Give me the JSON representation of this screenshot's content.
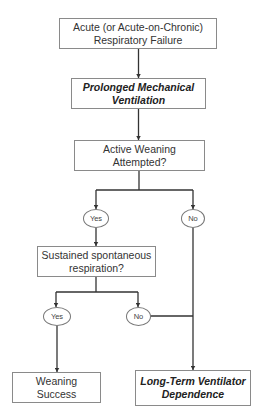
{
  "diagram": {
    "type": "flowchart",
    "nodes": {
      "start": {
        "label": "Acute (or Acute-on-Chronic)\nRespiratory Failure",
        "style": "normal"
      },
      "pmv": {
        "label": "Prolonged Mechanical\nVentilation",
        "style": "bold-italic"
      },
      "weaning_q": {
        "label": "Active Weaning\nAttempted?",
        "style": "normal"
      },
      "yes1": {
        "label": "Yes"
      },
      "no1": {
        "label": "No"
      },
      "sustained_q": {
        "label": "Sustained spontaneous\nrespiration?",
        "style": "normal"
      },
      "yes2": {
        "label": "Yes"
      },
      "no2": {
        "label": "No"
      },
      "success": {
        "label": "Weaning\nSuccess",
        "style": "normal"
      },
      "ltvd": {
        "label": "Long-Term Ventilator\nDependence",
        "style": "bold-italic"
      }
    },
    "edges": [
      [
        "start",
        "pmv"
      ],
      [
        "pmv",
        "weaning_q"
      ],
      [
        "weaning_q",
        "yes1"
      ],
      [
        "weaning_q",
        "no1"
      ],
      [
        "yes1",
        "sustained_q"
      ],
      [
        "no1",
        "ltvd"
      ],
      [
        "sustained_q",
        "yes2"
      ],
      [
        "sustained_q",
        "no2"
      ],
      [
        "yes2",
        "success"
      ],
      [
        "no2",
        "ltvd"
      ]
    ],
    "colors": {
      "line": "#333333",
      "border": "#8a8a8a",
      "background": "#ffffff"
    }
  }
}
